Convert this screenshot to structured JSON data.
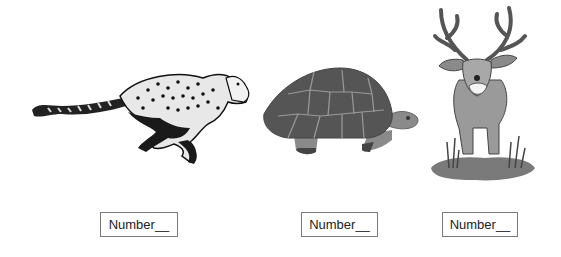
{
  "animals": [
    {
      "name": "cheetah",
      "label": "Number__"
    },
    {
      "name": "tortoise",
      "label": "Number__"
    },
    {
      "name": "deer",
      "label": "Number__"
    }
  ]
}
